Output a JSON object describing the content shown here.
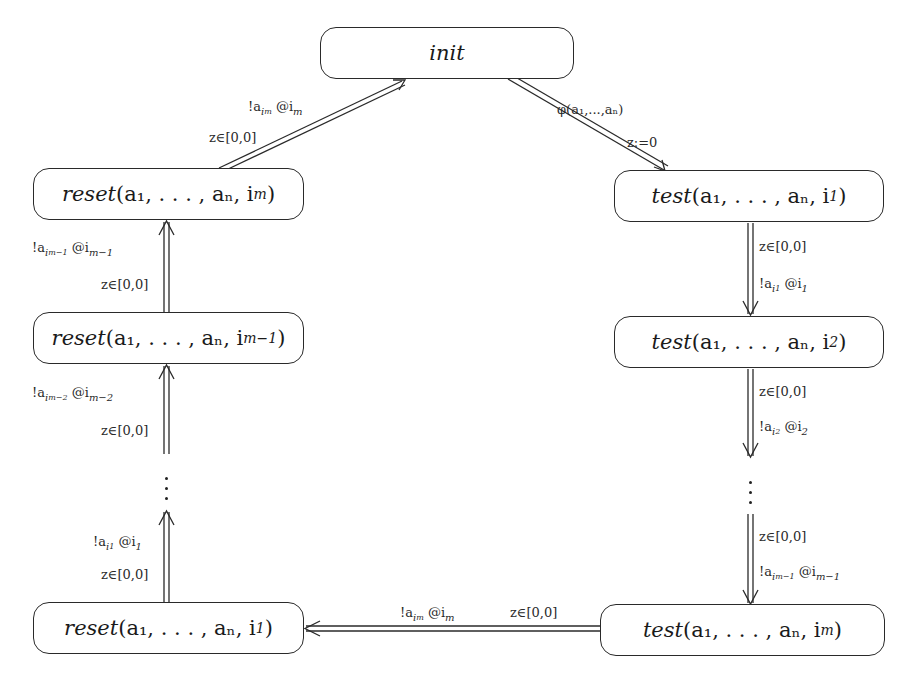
{
  "diagram": {
    "type": "state-machine",
    "nodes": [
      {
        "id": "init",
        "label": "init",
        "x": 320,
        "y": 27,
        "w": 254,
        "h": 52
      },
      {
        "id": "reset_im",
        "label_prefix": "reset",
        "label_args": "a₁, …, aₙ, i",
        "label_sub": "m",
        "x": 33,
        "y": 168,
        "w": 271,
        "h": 52
      },
      {
        "id": "reset_im1",
        "label_prefix": "reset",
        "label_args": "a₁, …, aₙ, i",
        "label_sub": "m−1",
        "x": 33,
        "y": 312,
        "w": 271,
        "h": 52
      },
      {
        "id": "reset_i1",
        "label_prefix": "reset",
        "label_args": "a₁, …, aₙ, i",
        "label_sub": "1",
        "x": 33,
        "y": 602,
        "w": 271,
        "h": 52
      },
      {
        "id": "test_i1",
        "label_prefix": "test",
        "label_args": "a₁, …, aₙ, i",
        "label_sub": "1",
        "x": 614,
        "y": 170,
        "w": 270,
        "h": 52
      },
      {
        "id": "test_i2",
        "label_prefix": "test",
        "label_args": "a₁, …, aₙ, i",
        "label_sub": "2",
        "x": 614,
        "y": 316,
        "w": 270,
        "h": 52
      },
      {
        "id": "test_im",
        "label_prefix": "test",
        "label_args": "a₁, …, aₙ, i",
        "label_sub": "m",
        "x": 600,
        "y": 604,
        "w": 285,
        "h": 52
      }
    ],
    "edges": [
      {
        "id": "e_reset_im_to_init",
        "from": "reset_im",
        "to": "init",
        "labels": [
          "!a_{i_m} @i_m",
          "z∈[0,0]"
        ]
      },
      {
        "id": "e_init_to_test_i1",
        "from": "init",
        "to": "test_i1",
        "labels": [
          "φ(a₁,…,aₙ)",
          "z:=0"
        ]
      },
      {
        "id": "e_test_i1_to_test_i2",
        "from": "test_i1",
        "to": "test_i2",
        "labels": [
          "z∈[0,0]",
          "!a_{i_1} @i_1"
        ]
      },
      {
        "id": "e_test_i2_to_dots",
        "from": "test_i2",
        "to": "test_dots",
        "labels": [
          "z∈[0,0]",
          "!a_{i_2} @i_2"
        ]
      },
      {
        "id": "e_dots_to_test_im",
        "from": "test_dots",
        "to": "test_im",
        "labels": [
          "z∈[0,0]",
          "!a_{i_{m-1}} @i_{m-1}"
        ]
      },
      {
        "id": "e_test_im_to_reset_i1",
        "from": "test_im",
        "to": "reset_i1",
        "labels": [
          "!a_{i_m} @i_m",
          "z∈[0,0]"
        ]
      },
      {
        "id": "e_reset_i1_to_dots",
        "from": "reset_i1",
        "to": "reset_dots",
        "labels": [
          "!a_{i_1} @i_1",
          "z∈[0,0]"
        ]
      },
      {
        "id": "e_dots_to_reset_im1",
        "from": "reset_dots",
        "to": "reset_im1",
        "labels": [
          "!a_{i_{m-2}} @i_{m-2}",
          "z∈[0,0]"
        ]
      },
      {
        "id": "e_reset_im1_to_reset_im",
        "from": "reset_im1",
        "to": "reset_im",
        "labels": [
          "!a_{i_{m-1}} @i_{m-1}",
          "z∈[0,0]"
        ]
      }
    ],
    "text": {
      "init": "init",
      "reset": "reset",
      "test": "test",
      "args": "(a₁, . . . , aₙ, i",
      "close": ")",
      "sub_m": "m",
      "sub_m1": "m−1",
      "sub_1": "1",
      "sub_2": "2",
      "guard": "z∈[0,0]",
      "phi": "φ(a₁,...,aₙ)",
      "reset_clock": "z:=0",
      "bang_a": "!a",
      "at_i": " @i",
      "i": "i",
      "m": "m",
      "m1": "m−1",
      "m2": "m−2",
      "one": "1",
      "two": "2"
    },
    "colors": {
      "stroke": "#2a2a2a",
      "background": "#ffffff",
      "text": "#1a1a1a"
    }
  }
}
